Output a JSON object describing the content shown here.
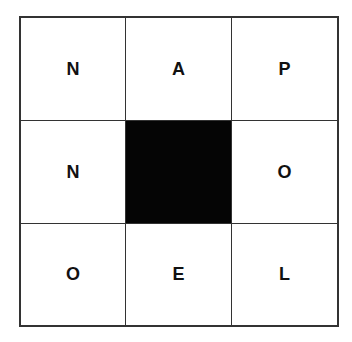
{
  "puzzle": {
    "type": "nine-letter-word-grid",
    "colors": {
      "cell": "#ffffff",
      "blocked": "#050505",
      "line": "#333333",
      "letter": "#111111"
    },
    "cells": [
      {
        "row": 0,
        "col": 0,
        "letter": "N",
        "blocked": false
      },
      {
        "row": 0,
        "col": 1,
        "letter": "A",
        "blocked": false
      },
      {
        "row": 0,
        "col": 2,
        "letter": "P",
        "blocked": false
      },
      {
        "row": 1,
        "col": 0,
        "letter": "N",
        "blocked": false
      },
      {
        "row": 1,
        "col": 1,
        "letter": "",
        "blocked": true
      },
      {
        "row": 1,
        "col": 2,
        "letter": "O",
        "blocked": false
      },
      {
        "row": 2,
        "col": 0,
        "letter": "O",
        "blocked": false
      },
      {
        "row": 2,
        "col": 1,
        "letter": "E",
        "blocked": false
      },
      {
        "row": 2,
        "col": 2,
        "letter": "L",
        "blocked": false
      }
    ]
  }
}
